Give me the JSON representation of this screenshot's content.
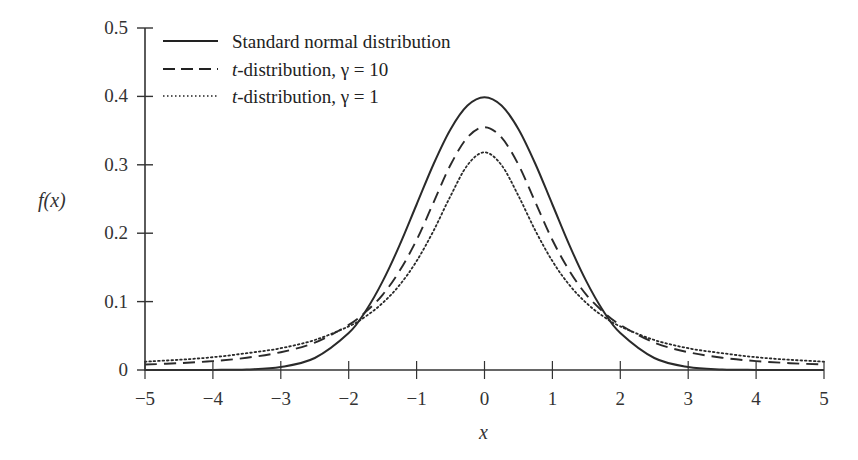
{
  "chart_data": {
    "type": "line",
    "title": "",
    "xlabel": "x",
    "ylabel": "f(x)",
    "xlim": [
      -5,
      5
    ],
    "ylim": [
      0,
      0.5
    ],
    "grid": false,
    "legend_position": "upper-left",
    "x_ticks": [
      "−5",
      "−4",
      "−3",
      "−2",
      "−1",
      "0",
      "1",
      "2",
      "3",
      "4",
      "5"
    ],
    "x_tick_values": [
      -5,
      -4,
      -3,
      -2,
      -1,
      0,
      1,
      2,
      3,
      4,
      5
    ],
    "y_ticks": [
      "0",
      "0.1",
      "0.2",
      "0.3",
      "0.4",
      "0.5"
    ],
    "y_tick_values": [
      0,
      0.1,
      0.2,
      0.3,
      0.4,
      0.5
    ],
    "x": [
      -5,
      -4.5,
      -4,
      -3.5,
      -3,
      -2.5,
      -2,
      -1.75,
      -1.5,
      -1.25,
      -1,
      -0.75,
      -0.5,
      -0.25,
      0,
      0.25,
      0.5,
      0.75,
      1,
      1.25,
      1.5,
      1.75,
      2,
      2.5,
      3,
      3.5,
      4,
      4.5,
      5
    ],
    "series": [
      {
        "name": "Standard normal distribution",
        "style": "solid",
        "values": [
          0.0,
          0.0,
          0.0001,
          0.0009,
          0.0044,
          0.0175,
          0.054,
          0.0863,
          0.1295,
          0.1826,
          0.242,
          0.3011,
          0.3521,
          0.3867,
          0.3989,
          0.3867,
          0.3521,
          0.3011,
          0.242,
          0.1826,
          0.1295,
          0.0863,
          0.054,
          0.0175,
          0.0044,
          0.0009,
          0.0001,
          0.0,
          0.0
        ]
      },
      {
        "name": "t-distribution, γ = 10",
        "style": "dashed",
        "values": [
          0.008,
          0.01,
          0.013,
          0.018,
          0.026,
          0.04,
          0.066,
          0.085,
          0.11,
          0.145,
          0.19,
          0.245,
          0.3,
          0.34,
          0.355,
          0.34,
          0.3,
          0.245,
          0.19,
          0.145,
          0.11,
          0.085,
          0.066,
          0.04,
          0.026,
          0.018,
          0.013,
          0.01,
          0.008
        ]
      },
      {
        "name": "t-distribution, γ = 1",
        "style": "dotted",
        "values": [
          0.0122,
          0.0149,
          0.0187,
          0.0245,
          0.0318,
          0.0439,
          0.0637,
          0.0784,
          0.0979,
          0.1242,
          0.1592,
          0.2037,
          0.2546,
          0.2996,
          0.3183,
          0.2996,
          0.2546,
          0.2037,
          0.1592,
          0.1242,
          0.0979,
          0.0784,
          0.0637,
          0.0439,
          0.0318,
          0.0245,
          0.0187,
          0.0149,
          0.0122
        ]
      }
    ]
  },
  "legend": {
    "items": [
      {
        "prefix": "",
        "label": "Standard normal distribution",
        "style": "solid"
      },
      {
        "prefix": "t",
        "label": "-distribution, γ = 10",
        "style": "dashed"
      },
      {
        "prefix": "t",
        "label": "-distribution, γ = 1",
        "style": "dotted"
      }
    ]
  },
  "axes": {
    "xlabel": "x",
    "ylabel": "f(x)"
  }
}
